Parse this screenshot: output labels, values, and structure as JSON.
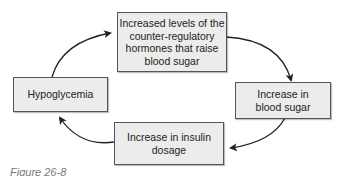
{
  "diagram": {
    "type": "cycle",
    "nodes": [
      {
        "id": "counter_reg",
        "label": "Increased levels of the counter-regulatory hormones that raise blood sugar"
      },
      {
        "id": "blood_sugar",
        "label": "Increase in blood sugar"
      },
      {
        "id": "insulin",
        "label": "Increase in insulin dosage"
      },
      {
        "id": "hypo",
        "label": "Hypoglycemia"
      }
    ],
    "edges": [
      {
        "from": "hypo",
        "to": "counter_reg"
      },
      {
        "from": "counter_reg",
        "to": "blood_sugar"
      },
      {
        "from": "blood_sugar",
        "to": "insulin"
      },
      {
        "from": "insulin",
        "to": "hypo"
      }
    ],
    "colors": {
      "box_fill": "#ececec",
      "box_border": "#555555",
      "arrow": "#222222"
    }
  },
  "caption": "Figure 26-8"
}
